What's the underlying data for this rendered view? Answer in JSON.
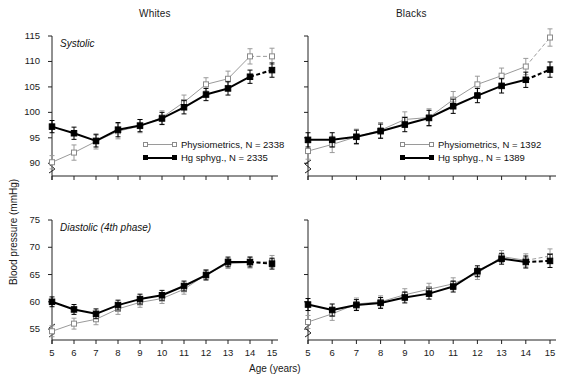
{
  "figure": {
    "y_axis_label": "Blood pressure (mmHg)",
    "x_axis_label": "Age (years)",
    "panel_titles": [
      "Whites",
      "Blacks"
    ],
    "row_labels": [
      "Systolic",
      "Diastolic (4th phase)"
    ]
  },
  "legend": {
    "series_open_name": "Physiometrics",
    "series_solid_name": "Hg sphyg.",
    "n_symbol": "N",
    "equals": "=",
    "whites_open_n": "2338",
    "whites_solid_n": "2335",
    "blacks_open_n": "1392",
    "blacks_solid_n": "1389",
    "whites_open_label": "Physiometrics, N = 2338",
    "whites_solid_label": "Hg sphyg., N = 2335",
    "blacks_open_label": "Physiometrics, N = 1392",
    "blacks_solid_label": "Hg sphyg., N = 1389"
  },
  "colors": {
    "open_series": "#9a9a9a",
    "solid_series": "#000000",
    "axis": "#222222",
    "text": "#1a1a1a",
    "background": "#ffffff"
  },
  "chart_data": [
    {
      "id": "whites-systolic",
      "type": "line",
      "title": "Whites",
      "annotation": "Systolic",
      "xlabel": "Age (years)",
      "ylabel": "Blood pressure (mmHg)",
      "x": [
        5,
        6,
        7,
        8,
        9,
        10,
        11,
        12,
        13,
        14,
        15
      ],
      "xticks": [
        5,
        6,
        7,
        8,
        9,
        10,
        11,
        12,
        13,
        14,
        15
      ],
      "yticks": [
        90,
        95,
        100,
        105,
        110,
        115
      ],
      "ylim": [
        87.5,
        115
      ],
      "axis_break": true,
      "grid": false,
      "legend_position": "lower-right-inside",
      "series": [
        {
          "name": "Physiometrics",
          "n": 2338,
          "marker": "open-square",
          "line": "thin-grey",
          "dashed_from_x": 14,
          "values": [
            90.2,
            92.1,
            94.3,
            96.3,
            97.3,
            99.0,
            102.0,
            105.5,
            106.6,
            111.0,
            111.0
          ],
          "errors": [
            1.3,
            1.5,
            1.5,
            1.5,
            1.3,
            1.3,
            1.4,
            1.3,
            1.5,
            1.5,
            1.6
          ]
        },
        {
          "name": "Hg sphyg.",
          "n": 2335,
          "marker": "filled-square",
          "line": "thick-black",
          "dashed_from_x": 14,
          "values": [
            97.2,
            95.9,
            94.4,
            96.6,
            97.4,
            98.8,
            101.0,
            103.5,
            104.7,
            107.0,
            108.3
          ],
          "errors": [
            1.2,
            1.2,
            1.2,
            1.4,
            1.2,
            1.2,
            1.3,
            1.2,
            1.3,
            1.3,
            1.4
          ]
        }
      ]
    },
    {
      "id": "blacks-systolic",
      "type": "line",
      "title": "Blacks",
      "annotation": "Systolic",
      "xlabel": "Age (years)",
      "ylabel": "Blood pressure (mmHg)",
      "x": [
        5,
        6,
        7,
        8,
        9,
        10,
        11,
        12,
        13,
        14,
        15
      ],
      "xticks": [
        5,
        6,
        7,
        8,
        9,
        10,
        11,
        12,
        13,
        14,
        15
      ],
      "yticks": [
        90,
        95,
        100,
        105,
        110,
        115
      ],
      "ylim": [
        87.5,
        115
      ],
      "axis_break": true,
      "grid": false,
      "legend_position": "lower-right-inside",
      "series": [
        {
          "name": "Physiometrics",
          "n": 1392,
          "marker": "open-square",
          "line": "thin-grey",
          "dashed_from_x": 14,
          "values": [
            92.4,
            93.7,
            95.2,
            96.5,
            98.6,
            99.0,
            102.5,
            105.5,
            107.2,
            109.0,
            114.7
          ],
          "errors": [
            1.6,
            1.6,
            1.5,
            1.5,
            1.5,
            1.7,
            1.6,
            1.6,
            1.5,
            1.6,
            1.7
          ]
        },
        {
          "name": "Hg sphyg.",
          "n": 1389,
          "marker": "filled-square",
          "line": "thick-black",
          "dashed_from_x": 14,
          "values": [
            94.6,
            94.6,
            95.2,
            96.3,
            97.6,
            98.9,
            101.2,
            103.3,
            105.2,
            106.4,
            108.4
          ],
          "errors": [
            1.4,
            1.4,
            1.3,
            1.4,
            1.4,
            1.5,
            1.4,
            1.4,
            1.4,
            1.5,
            1.5
          ]
        }
      ]
    },
    {
      "id": "whites-diastolic",
      "type": "line",
      "title": "Whites",
      "annotation": "Diastolic (4th phase)",
      "xlabel": "Age (years)",
      "ylabel": "Blood pressure (mmHg)",
      "x": [
        5,
        6,
        7,
        8,
        9,
        10,
        11,
        12,
        13,
        14,
        15
      ],
      "xticks": [
        5,
        6,
        7,
        8,
        9,
        10,
        11,
        12,
        13,
        14,
        15
      ],
      "yticks": [
        55,
        60,
        65,
        70,
        75
      ],
      "ylim": [
        53,
        75
      ],
      "axis_break": true,
      "grid": false,
      "legend_position": "none",
      "series": [
        {
          "name": "Physiometrics",
          "n": 2338,
          "marker": "open-square",
          "line": "thin-grey",
          "dashed_from_x": 14,
          "values": [
            54.6,
            56.0,
            56.8,
            58.7,
            59.9,
            60.6,
            62.3,
            65.0,
            67.0,
            67.2,
            67.4
          ],
          "errors": [
            1.0,
            1.0,
            1.0,
            1.0,
            0.9,
            0.9,
            0.9,
            0.9,
            0.9,
            1.0,
            1.1
          ]
        },
        {
          "name": "Hg sphyg.",
          "n": 2335,
          "marker": "filled-square",
          "line": "thick-black",
          "dashed_from_x": 14,
          "values": [
            60.0,
            58.6,
            57.8,
            59.4,
            60.5,
            61.2,
            62.9,
            64.9,
            67.3,
            67.3,
            67.0
          ],
          "errors": [
            0.9,
            0.9,
            0.9,
            0.9,
            0.9,
            0.9,
            0.9,
            0.9,
            0.9,
            0.9,
            1.0
          ]
        }
      ]
    },
    {
      "id": "blacks-diastolic",
      "type": "line",
      "title": "Blacks",
      "annotation": "Diastolic (4th phase)",
      "xlabel": "Age (years)",
      "ylabel": "Blood pressure (mmHg)",
      "x": [
        5,
        6,
        7,
        8,
        9,
        10,
        11,
        12,
        13,
        14,
        15
      ],
      "xticks": [
        5,
        6,
        7,
        8,
        9,
        10,
        11,
        12,
        13,
        14,
        15
      ],
      "yticks": [
        55,
        60,
        65,
        70,
        75
      ],
      "ylim": [
        53,
        75
      ],
      "axis_break": true,
      "grid": false,
      "legend_position": "none",
      "series": [
        {
          "name": "Physiometrics",
          "n": 1392,
          "marker": "open-square",
          "line": "thin-grey",
          "dashed_from_x": 14,
          "values": [
            56.3,
            57.8,
            59.6,
            60.0,
            61.3,
            62.3,
            63.3,
            65.2,
            68.3,
            67.6,
            68.4
          ],
          "errors": [
            1.2,
            1.2,
            1.1,
            1.1,
            1.1,
            1.1,
            1.1,
            1.1,
            1.1,
            1.2,
            1.3
          ]
        },
        {
          "name": "Hg sphyg.",
          "n": 1389,
          "marker": "filled-square",
          "line": "thick-black",
          "dashed_from_x": 14,
          "values": [
            59.5,
            58.5,
            59.4,
            59.8,
            60.8,
            61.5,
            62.8,
            65.6,
            67.9,
            67.3,
            67.5
          ],
          "errors": [
            1.1,
            1.1,
            1.0,
            1.0,
            1.0,
            1.0,
            1.0,
            1.0,
            1.0,
            1.1,
            1.2
          ]
        }
      ]
    }
  ]
}
